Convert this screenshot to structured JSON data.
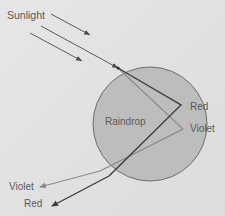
{
  "diagram": {
    "labels": {
      "sunlight": "Sunlight",
      "raindrop": "Raindrop",
      "red_reflect": "Red",
      "violet_reflect": "Violet",
      "violet_out": "Violet",
      "red_out": "Red"
    },
    "colors": {
      "background": "#e3e3e3",
      "drop_fill": "#bdbdbd",
      "drop_stroke": "#6e6e6e",
      "red_ray": "#3c3c3c",
      "violet_ray": "#8a8a8a",
      "sun_ray": "#4a4a4a",
      "text": "#5a5a5a"
    },
    "nodes": [
      {
        "id": "sunlight",
        "label": "Sunlight"
      },
      {
        "id": "raindrop",
        "label": "Raindrop"
      },
      {
        "id": "red_reflect",
        "label": "Red"
      },
      {
        "id": "violet_reflect",
        "label": "Violet"
      },
      {
        "id": "violet_out",
        "label": "Violet"
      },
      {
        "id": "red_out",
        "label": "Red"
      }
    ],
    "edges": [
      {
        "from": "sunlight",
        "to": "raindrop",
        "kind": "incident-ray"
      },
      {
        "from": "raindrop",
        "to": "red_reflect",
        "kind": "refracted-red"
      },
      {
        "from": "raindrop",
        "to": "violet_reflect",
        "kind": "refracted-violet"
      },
      {
        "from": "red_reflect",
        "to": "red_out",
        "kind": "exit-red"
      },
      {
        "from": "violet_reflect",
        "to": "violet_out",
        "kind": "exit-violet"
      }
    ]
  }
}
